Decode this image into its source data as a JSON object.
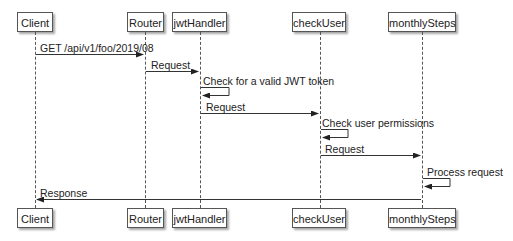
{
  "diagram": {
    "type": "sequence",
    "participants": [
      {
        "id": "client",
        "label": "Client",
        "x": 35,
        "box_left": 17,
        "box_width": 36
      },
      {
        "id": "router",
        "label": "Router",
        "x": 145,
        "box_left": 127,
        "box_width": 37
      },
      {
        "id": "jwthandler",
        "label": "jwtHandler",
        "x": 200,
        "box_left": 172,
        "box_width": 55
      },
      {
        "id": "checkuser",
        "label": "checkUser",
        "x": 320,
        "box_left": 292,
        "box_width": 54
      },
      {
        "id": "monthlysteps",
        "label": "monthlySteps",
        "x": 422,
        "box_left": 388,
        "box_width": 68
      }
    ],
    "messages": [
      {
        "from": "Client",
        "to": "Router",
        "label": "GET /api/v1/foo/2019/08",
        "y": 54
      },
      {
        "from": "Router",
        "to": "jwtHandler",
        "label": "Request",
        "y": 71
      },
      {
        "from": "jwtHandler",
        "to": "jwtHandler",
        "label": "Check for a valid JWT token",
        "y": 88,
        "self": true
      },
      {
        "from": "jwtHandler",
        "to": "checkUser",
        "label": "Request",
        "y": 113
      },
      {
        "from": "checkUser",
        "to": "checkUser",
        "label": "Check user permissions",
        "y": 129,
        "self": true
      },
      {
        "from": "checkUser",
        "to": "monthlySteps",
        "label": "Request",
        "y": 155
      },
      {
        "from": "monthlySteps",
        "to": "monthlySteps",
        "label": "Process request",
        "y": 178,
        "self": true
      },
      {
        "from": "monthlySteps",
        "to": "Client",
        "label": "Response",
        "y": 199
      }
    ]
  }
}
